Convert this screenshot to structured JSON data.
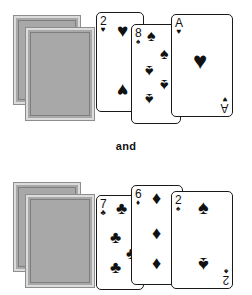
{
  "conjunction_label": "and",
  "colors": {
    "card_back_fill": "#a8a8a8",
    "card_back_border": "#dcdcdc",
    "card_back_frame": "#7e7e7e",
    "ink": "#111111",
    "card_face": "#ffffff",
    "background": "#ffffff"
  },
  "suit_glyphs": {
    "hearts": "♥",
    "spades": "♠",
    "diamonds": "♦",
    "clubs": "♣"
  },
  "hands": [
    {
      "name": "top-hand",
      "facedown_count": 2,
      "facedown_label": "card-back",
      "cards": [
        {
          "rank": "2",
          "suit": "hearts",
          "suit_glyph": "♥",
          "label": "2 of hearts",
          "pip_count": 2
        },
        {
          "rank": "8",
          "suit": "spades",
          "suit_glyph": "♠",
          "label": "8 of spades",
          "pip_count": 8
        },
        {
          "rank": "A",
          "suit": "hearts",
          "suit_glyph": "♥",
          "label": "Ace of hearts",
          "pip_count": 1
        }
      ]
    },
    {
      "name": "bottom-hand",
      "facedown_count": 2,
      "facedown_label": "card-back",
      "cards": [
        {
          "rank": "7",
          "suit": "clubs",
          "suit_glyph": "♣",
          "label": "7 of clubs",
          "pip_count": 7
        },
        {
          "rank": "6",
          "suit": "diamonds",
          "suit_glyph": "♦",
          "label": "6 of diamonds",
          "pip_count": 6
        },
        {
          "rank": "2",
          "suit": "spades",
          "suit_glyph": "♠",
          "label": "2 of spades",
          "pip_count": 2
        }
      ]
    }
  ]
}
